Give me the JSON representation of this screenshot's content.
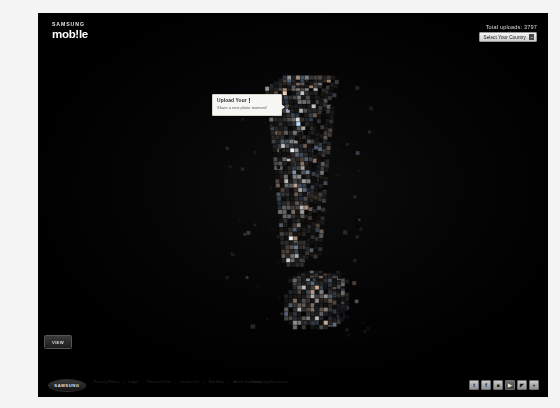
{
  "header": {
    "brand_top": "SAMSUNG",
    "brand_main": "mob!le",
    "uploads_label": "Total uploads: 3797",
    "country_button_label": "Select Your Country",
    "country_chevron_icon": "chevron-down-icon"
  },
  "callout": {
    "title_prefix": "Upload Your ",
    "title_bang": "!",
    "subtitle": "Share a new photo moment!"
  },
  "view_button": {
    "label": "VIEW"
  },
  "mosaic": {
    "description": "3D exclamation mark built from photo tiles",
    "tile_count_visible": 3797,
    "accent_color": "#ffffff",
    "background_color": "#000000"
  },
  "footer": {
    "logo_text": "SAMSUNG",
    "links": [
      "Privacy Policy",
      "Legal",
      "Terms of Use",
      "Contact Us",
      "Site Map",
      "About Samsung"
    ],
    "separator": "|",
    "copyright": "Samsung Electronics",
    "social": [
      {
        "name": "twitter-icon",
        "glyph": "t",
        "style": "light"
      },
      {
        "name": "facebook-icon",
        "glyph": "f",
        "style": "light"
      },
      {
        "name": "flickr-icon",
        "glyph": "■",
        "style": "light"
      },
      {
        "name": "youtube-icon",
        "glyph": "▶",
        "style": "dark"
      },
      {
        "name": "rss-icon",
        "glyph": "◤",
        "style": "light"
      },
      {
        "name": "share-icon",
        "glyph": "+",
        "style": "light"
      }
    ]
  },
  "colors": {
    "stage_background": "#000000",
    "page_background": "#f4f4f4",
    "callout_background": "#f7f7f4",
    "button_text": "#111111"
  }
}
